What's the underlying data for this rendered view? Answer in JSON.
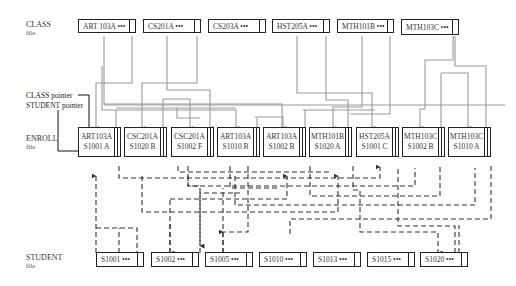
{
  "labels": {
    "class_file": {
      "title": "CLASS",
      "sub": "file"
    },
    "enroll_file": {
      "title": "ENROLL",
      "sub": "file"
    },
    "student_file": {
      "title": "STUDENT",
      "sub": "file"
    },
    "class_pointer": "CLASS pointer",
    "student_pointer": "STUDENT pointer"
  },
  "class_records": [
    {
      "text": "ART 103A •••"
    },
    {
      "text": "CS201A •••"
    },
    {
      "text": "CS203A •••"
    },
    {
      "text": "HST205A •••"
    },
    {
      "text": "MTH101B •••"
    },
    {
      "text": "MTH103C •••"
    }
  ],
  "enroll_records": [
    {
      "line1": "ART103A",
      "line2": "S1001 A"
    },
    {
      "line1": "CSC201A",
      "line2": "S1020 B"
    },
    {
      "line1": "CSC201A",
      "line2": "S1002 F"
    },
    {
      "line1": "ART103A",
      "line2": "S1010 B"
    },
    {
      "line1": "ART103A",
      "line2": "S1002 B"
    },
    {
      "line1": "MTH101B",
      "line2": "S1020 A"
    },
    {
      "line1": "HST205A",
      "line2": "S1001 C"
    },
    {
      "line1": "MTH103C",
      "line2": "S1002 B"
    },
    {
      "line1": "MTH103C",
      "line2": "S1010 A"
    }
  ],
  "student_records": [
    {
      "text": "S1001 •••"
    },
    {
      "text": "S1002 •••"
    },
    {
      "text": "S1005 •••"
    },
    {
      "text": "S1010 •••"
    },
    {
      "text": "S1013 •••"
    },
    {
      "text": "S1015 •••"
    },
    {
      "text": "S1020 •••"
    }
  ],
  "colors": {
    "class_link": "#9a9a9a",
    "student_link": "#333333",
    "border": "#222222"
  }
}
